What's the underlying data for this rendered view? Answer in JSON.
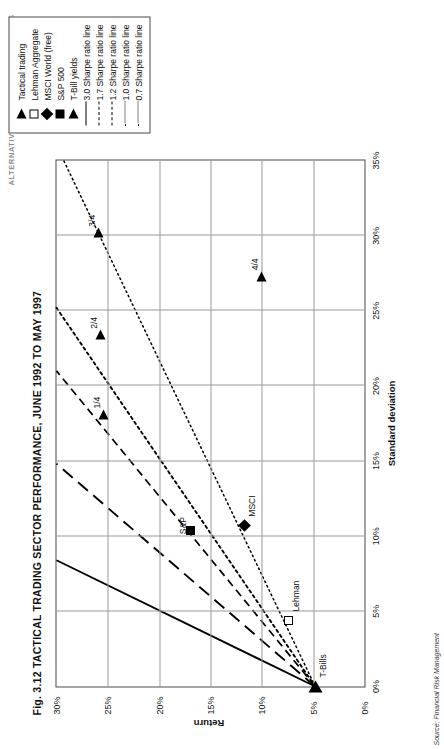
{
  "page_header": "ALTERNATIVE INVESTMENT STRATEGIES",
  "figure": {
    "title": "Fig. 3.12 TACTICAL TRADING SECTOR PERFORMANCE, JUNE 1992 TO MAY 1997",
    "source": "Source: Financial Risk Management"
  },
  "legend": {
    "items": [
      {
        "label": "Tactical trading",
        "key": "triangle-filled"
      },
      {
        "label": "Lehman Aggregate",
        "key": "square-open"
      },
      {
        "label": "MSCI World (free)",
        "key": "diamond-filled"
      },
      {
        "label": "S&P 500",
        "key": "square-filled"
      },
      {
        "label": "T-Bill yields",
        "key": "triangle-filled"
      },
      {
        "label": "3.0 Sharpe ratio line",
        "key": "line-solid"
      },
      {
        "label": "1.7 Sharpe ratio line",
        "key": "line-dash-long"
      },
      {
        "label": "1.2 Sharpe ratio line",
        "key": "line-dash-medium"
      },
      {
        "label": "1.0 Sharpe ratio line",
        "key": "line-dotted"
      },
      {
        "label": "0.7 Sharpe ratio line",
        "key": "line-dotted-fine"
      }
    ]
  },
  "chart_data": {
    "type": "scatter",
    "title": "Fig. 3.12 TACTICAL TRADING SECTOR PERFORMANCE, JUNE 1992 TO MAY 1997",
    "xlabel": "Standard deviation",
    "ylabel": "Return",
    "xlim": [
      0,
      35
    ],
    "ylim": [
      0,
      30
    ],
    "grid": true,
    "legend_position": "top-right-outside",
    "xticks": [
      "0%",
      "5%",
      "10%",
      "15%",
      "20%",
      "25%",
      "30%",
      "35%"
    ],
    "xtick_values": [
      0,
      5,
      10,
      15,
      20,
      25,
      30,
      35
    ],
    "yticks": [
      "0%",
      "5%",
      "10%",
      "15%",
      "20%",
      "25%",
      "30%"
    ],
    "ytick_values": [
      0,
      5,
      10,
      15,
      20,
      25,
      30
    ],
    "points": [
      {
        "name": "T-Bills",
        "label": "T-Bills",
        "x": 0.0,
        "y": 4.8,
        "marker": "triangle-filled"
      },
      {
        "name": "Lehman",
        "label": "Lehman",
        "x": 4.4,
        "y": 7.4,
        "marker": "square-open"
      },
      {
        "name": "MSCI",
        "label": "MSCI",
        "x": 10.7,
        "y": 11.7,
        "marker": "diamond-filled"
      },
      {
        "name": "S&P",
        "label": "S&P",
        "x": 10.4,
        "y": 16.9,
        "marker": "square-filled"
      },
      {
        "name": "Q1",
        "label": "1/4",
        "x": 18.1,
        "y": 25.4,
        "marker": "triangle-filled"
      },
      {
        "name": "Q2",
        "label": "2/4",
        "x": 23.4,
        "y": 25.7,
        "marker": "triangle-filled"
      },
      {
        "name": "Q3",
        "label": "3/4",
        "x": 30.2,
        "y": 25.9,
        "marker": "triangle-filled"
      },
      {
        "name": "Q4",
        "label": "4/4",
        "x": 27.3,
        "y": 10.0,
        "marker": "triangle-filled"
      }
    ],
    "sharpe_lines": [
      {
        "ratio": 3.0,
        "style": "solid",
        "intercept": 4.8,
        "x_end": 35,
        "y_end": 30
      },
      {
        "ratio": 1.7,
        "style": "dash-long",
        "intercept": 4.8,
        "x_end": 35,
        "y_end": 30
      },
      {
        "ratio": 1.2,
        "style": "dash-medium",
        "intercept": 4.8,
        "x_end": 35,
        "y_end": 30
      },
      {
        "ratio": 1.0,
        "style": "dotted",
        "intercept": 4.8,
        "x_end": 35,
        "y_end": 30
      },
      {
        "ratio": 0.7,
        "style": "dotted-fine",
        "intercept": 4.8,
        "x_end": 35,
        "y_end": 30
      }
    ]
  }
}
